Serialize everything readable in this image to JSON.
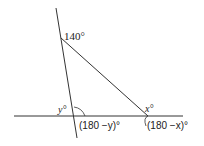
{
  "diagram": {
    "type": "geometry-angles",
    "line_color": "#333333",
    "labels": {
      "apex_angle": "140°",
      "left_angle": "y°",
      "right_angle": "x°",
      "left_supplement": "(180 −y)°",
      "right_supplement": "(180 −x)°"
    }
  }
}
